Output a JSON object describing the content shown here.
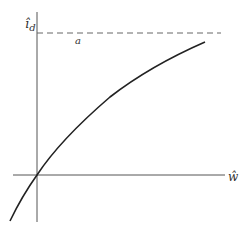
{
  "diagram": {
    "y_axis_label": "î",
    "y_axis_subscript": "d",
    "x_axis_label": "ŵ",
    "asymptote_label": "a",
    "colors": {
      "axis": "#555555",
      "curve": "#222222",
      "asymptote": "#666666",
      "background": "#ffffff"
    }
  }
}
